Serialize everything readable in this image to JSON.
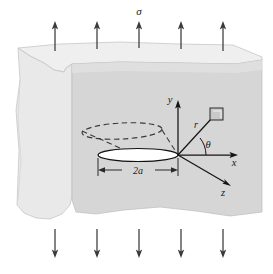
{
  "figure": {
    "labels": {
      "sigma": "σ",
      "y_axis": "y",
      "x_axis": "x",
      "z_axis": "z",
      "radius": "r",
      "theta": "θ",
      "crack_diameter": "2a"
    },
    "colors": {
      "background": "#ffffff",
      "block_front_face": "#d5d5d5",
      "block_top_face": "#efefef",
      "block_left_face": "#e8e8e8",
      "outline": "#b4b4b4",
      "arrow": "#3a3a3a",
      "axis": "#1a1a1a",
      "crack_fill": "#ffffff",
      "crack_outline": "#1a1a1a",
      "dashed_ellipse": "#3a3a3a",
      "element_box_fill": "#c8c8c8",
      "element_box_outline": "#2a2a2a"
    },
    "load_arrows": {
      "top_count": 5,
      "bottom_count": 5,
      "top_direction": "up",
      "bottom_direction": "down",
      "top_x_positions": [
        55,
        97,
        139,
        181,
        223
      ],
      "bottom_x_positions": [
        55,
        97,
        139,
        181,
        223
      ]
    },
    "geometry": {
      "origin_x": 178,
      "origin_y": 155,
      "crack_half_width_px": 40,
      "theta_degrees": 38
    }
  }
}
